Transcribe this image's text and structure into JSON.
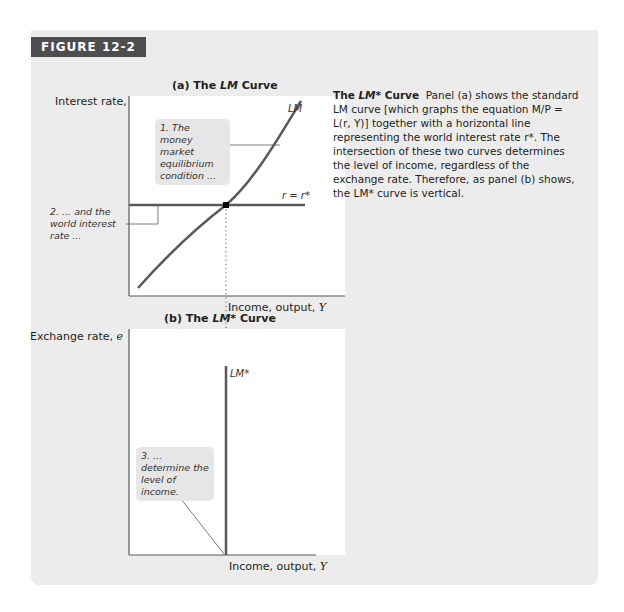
{
  "figure": {
    "label": "FIGURE 12-2",
    "colors": {
      "card_bg": "#ececec",
      "header_bg": "#4d4d4f",
      "header_text": "#ffffff",
      "plot_bg": "#ffffff",
      "curve": "#58595b",
      "callout_bg": "#e6e6e6"
    }
  },
  "panel_a": {
    "title_prefix": "(a) The ",
    "title_italic": "LM",
    "title_suffix": " Curve",
    "y_axis_label": "Interest rate, ",
    "y_axis_var": "r",
    "x_axis_label": "Income, output, ",
    "x_axis_var": "Y",
    "lm_label": "LM",
    "rstar_label": "r = r*",
    "callout_1": "1. The money market equilibrium condition ...",
    "callout_2": "2. ... and the world interest rate ..."
  },
  "panel_b": {
    "title_prefix": "(b) The ",
    "title_italic": "LM*",
    "title_suffix": " Curve",
    "y_axis_label": "Exchange rate, ",
    "y_axis_var": "e",
    "x_axis_label": "Income, output, ",
    "x_axis_var": "Y",
    "lmstar_label": "LM*",
    "callout_3": "3. ... determine the level of income."
  },
  "caption": {
    "heading_prefix": "The ",
    "heading_italic": "LM*",
    "heading_suffix": " Curve",
    "body": "Panel (a) shows the standard LM curve [which graphs the equation M/P = L(r, Y)] together with a horizontal line representing the world interest rate r*. The intersection of these two curves determines the level of income, regardless of the exchange rate. Therefore, as panel (b) shows, the LM* curve is vertical."
  }
}
